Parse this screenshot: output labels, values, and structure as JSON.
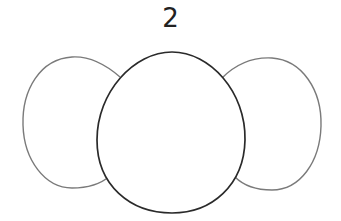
{
  "diagram": {
    "label": "2",
    "shapes": [
      {
        "name": "left-oval",
        "stroke": "#7a7a7a"
      },
      {
        "name": "right-oval",
        "stroke": "#7a7a7a"
      },
      {
        "name": "center-egg",
        "stroke": "#2a2a2a"
      }
    ]
  }
}
